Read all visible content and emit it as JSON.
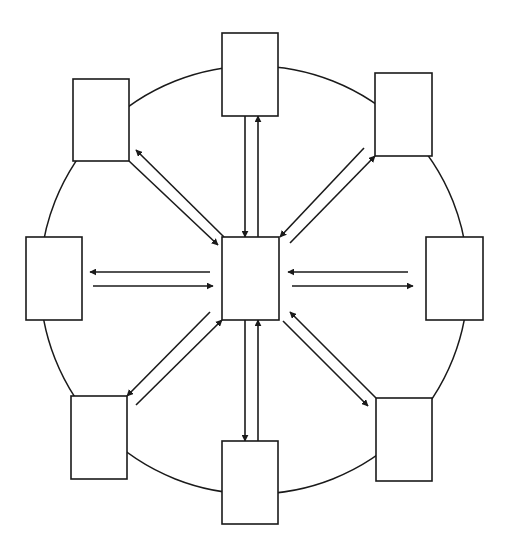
{
  "diagram": {
    "type": "hub-and-spoke",
    "colors": {
      "stroke": "#1a1a1a",
      "fill": "#ffffff",
      "background": "#ffffff"
    },
    "ring": {
      "cx": 254,
      "cy": 280,
      "r": 214
    },
    "center_node": {
      "id": "center",
      "label": "",
      "x": 222,
      "y": 237,
      "w": 57,
      "h": 83
    },
    "nodes": [
      {
        "id": "top",
        "label": "",
        "x": 222,
        "y": 33,
        "w": 56,
        "h": 83
      },
      {
        "id": "top-right",
        "label": "",
        "x": 375,
        "y": 73,
        "w": 57,
        "h": 83
      },
      {
        "id": "right",
        "label": "",
        "x": 426,
        "y": 237,
        "w": 57,
        "h": 83
      },
      {
        "id": "bottom-right",
        "label": "",
        "x": 376,
        "y": 398,
        "w": 56,
        "h": 83
      },
      {
        "id": "bottom",
        "label": "",
        "x": 222,
        "y": 441,
        "w": 56,
        "h": 83
      },
      {
        "id": "bottom-left",
        "label": "",
        "x": 71,
        "y": 396,
        "w": 56,
        "h": 83
      },
      {
        "id": "left",
        "label": "",
        "x": 26,
        "y": 237,
        "w": 56,
        "h": 83
      },
      {
        "id": "top-left",
        "label": "",
        "x": 73,
        "y": 79,
        "w": 56,
        "h": 82
      }
    ],
    "arrows": [
      {
        "id": "top-to-center",
        "x1": 245,
        "y1": 116,
        "x2": 245,
        "y2": 237
      },
      {
        "id": "center-to-top",
        "x1": 258,
        "y1": 237,
        "x2": 258,
        "y2": 116
      },
      {
        "id": "center-to-bottom",
        "x1": 245,
        "y1": 320,
        "x2": 245,
        "y2": 441
      },
      {
        "id": "bottom-to-center",
        "x1": 258,
        "y1": 441,
        "x2": 258,
        "y2": 320
      },
      {
        "id": "center-to-left",
        "x1": 210,
        "y1": 272,
        "x2": 90,
        "y2": 272
      },
      {
        "id": "left-to-center",
        "x1": 93,
        "y1": 286,
        "x2": 213,
        "y2": 286
      },
      {
        "id": "right-to-center",
        "x1": 408,
        "y1": 272,
        "x2": 288,
        "y2": 272
      },
      {
        "id": "center-to-right",
        "x1": 292,
        "y1": 286,
        "x2": 413,
        "y2": 286
      },
      {
        "id": "topleft-to-center",
        "x1": 129,
        "y1": 161,
        "x2": 218,
        "y2": 245
      },
      {
        "id": "center-to-topleft",
        "x1": 224,
        "y1": 237,
        "x2": 136,
        "y2": 150
      },
      {
        "id": "topright-to-center",
        "x1": 364,
        "y1": 148,
        "x2": 280,
        "y2": 237
      },
      {
        "id": "center-to-topright",
        "x1": 290,
        "y1": 243,
        "x2": 375,
        "y2": 156
      },
      {
        "id": "center-to-bottomleft",
        "x1": 210,
        "y1": 312,
        "x2": 127,
        "y2": 396
      },
      {
        "id": "bottomleft-to-center",
        "x1": 136,
        "y1": 405,
        "x2": 222,
        "y2": 320
      },
      {
        "id": "bottomright-to-center",
        "x1": 376,
        "y1": 398,
        "x2": 290,
        "y2": 312
      },
      {
        "id": "center-to-bottomright",
        "x1": 283,
        "y1": 321,
        "x2": 368,
        "y2": 406
      }
    ]
  }
}
